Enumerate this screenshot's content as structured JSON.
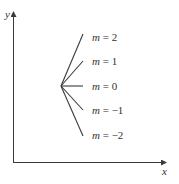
{
  "diagram": {
    "axes": {
      "x_label": "x",
      "y_label": "y"
    },
    "origin_point": {
      "x": 61,
      "y": 86
    },
    "lines": [
      {
        "m": "2",
        "label_var": "m",
        "label_eq": " = 2",
        "end": {
          "x": 83,
          "y": 34
        }
      },
      {
        "m": "1",
        "label_var": "m",
        "label_eq": " = 1",
        "end": {
          "x": 83,
          "y": 61
        }
      },
      {
        "m": "0",
        "label_var": "m",
        "label_eq": " = 0",
        "end": {
          "x": 83,
          "y": 86
        }
      },
      {
        "m": "-1",
        "label_var": "m",
        "label_eq": " = −1",
        "end": {
          "x": 83,
          "y": 110
        }
      },
      {
        "m": "-2",
        "label_var": "m",
        "label_eq": " = −2",
        "end": {
          "x": 83,
          "y": 136
        }
      }
    ],
    "colors": {
      "line": "#3a3a3a",
      "axis": "#3a3a3a",
      "text": "#333333"
    }
  }
}
